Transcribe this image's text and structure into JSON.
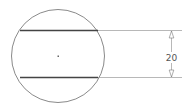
{
  "diagram": {
    "type": "technical-drawing",
    "shape": "circle-with-two-parallel-chords",
    "dimension": {
      "value_label": "20",
      "orientation": "vertical"
    },
    "colors": {
      "outline": "#8a8a8a",
      "chord": "#444444",
      "dimension_line": "#9a9a9a",
      "text": "#555555",
      "background": "#ffffff"
    }
  }
}
